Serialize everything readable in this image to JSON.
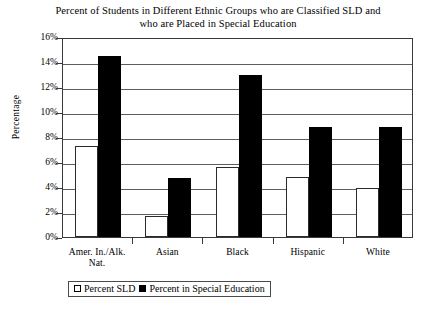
{
  "chart_data": {
    "type": "bar",
    "title": "Percent of Students in Different Ethnic Groups who are Classified SLD and who are Placed in Special Education",
    "title_lines": [
      "Percent of Students in Different Ethnic Groups who are Classified SLD and",
      "who are Placed in Special Education"
    ],
    "xlabel": "",
    "ylabel": "Percentage",
    "ylim": [
      0,
      16
    ],
    "ytick_labels": [
      "16%",
      "14%",
      "12%",
      "10%",
      "8%",
      "6%",
      "4%",
      "2%",
      "0%"
    ],
    "ytick_values": [
      16,
      14,
      12,
      10,
      8,
      6,
      4,
      2,
      0
    ],
    "grid": true,
    "legend_position": "bottom-center",
    "categories": [
      "Amer. In./Alk. Nat.",
      "Asian",
      "Black",
      "Hispanic",
      "White"
    ],
    "category_lines": [
      [
        "Amer. In./Alk.",
        "Nat."
      ],
      [
        "Asian"
      ],
      [
        "Black"
      ],
      [
        "Hispanic"
      ],
      [
        "White"
      ]
    ],
    "series": [
      {
        "name": "Percent SLD",
        "style": "open",
        "color": "#ffffff",
        "values": [
          7.3,
          1.7,
          5.6,
          4.8,
          3.9
        ]
      },
      {
        "name": "Percent in Special Education",
        "style": "filled",
        "color": "#000000",
        "values": [
          14.5,
          4.7,
          13.0,
          8.8,
          8.8
        ]
      }
    ]
  },
  "legend": {
    "entries": [
      {
        "label": "Percent SLD",
        "style": "open"
      },
      {
        "label": "Percent in Special Education",
        "style": "filled"
      }
    ]
  }
}
